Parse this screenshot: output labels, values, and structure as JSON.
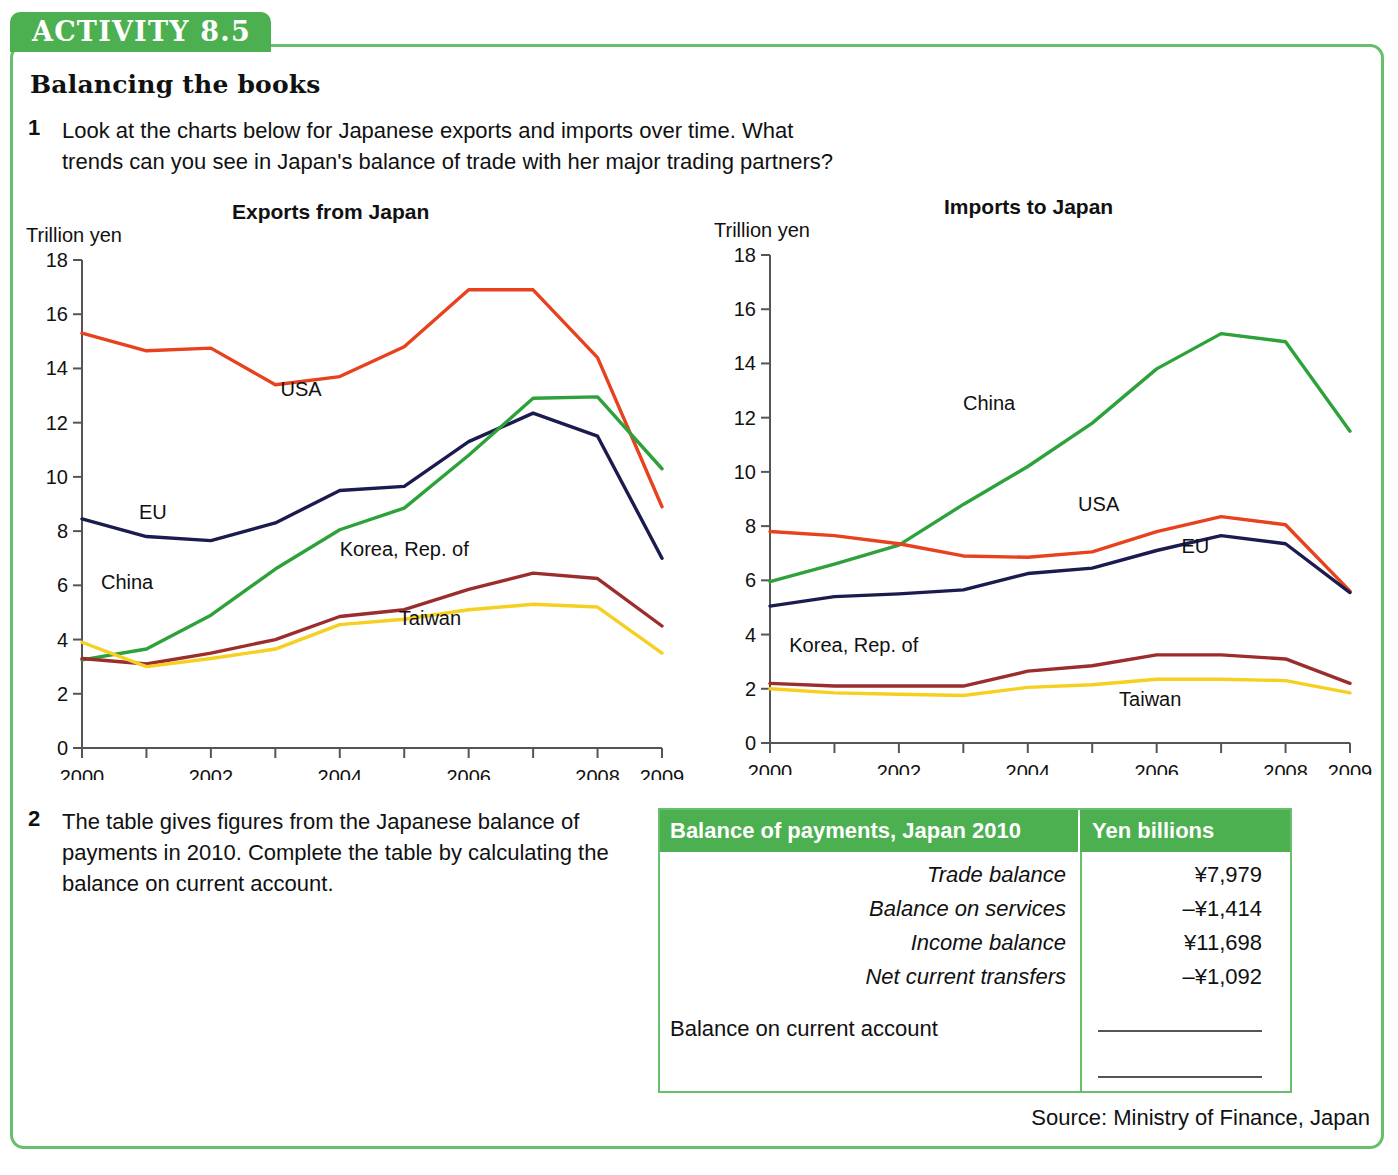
{
  "activity": {
    "tab_label": "ACTIVITY 8.5",
    "title": "Balancing the books"
  },
  "questions": [
    {
      "number": "1",
      "text": "Look at the charts below for Japanese exports and imports over time. What trends can you see in Japan's balance of trade with her major trading partners?"
    },
    {
      "number": "2",
      "text": "The table gives figures from the Japanese balance of payments in 2010. Complete the table by calculating the balance on current account."
    }
  ],
  "source_note": "Source: Ministry of Finance, Japan",
  "colors": {
    "brand_green": "#4CB050",
    "panel_border": "#67BE6B",
    "usa": "#E8411E",
    "eu": "#1B1B4F",
    "china": "#2DA13A",
    "korea": "#9B2D2D",
    "taiwan": "#F5D020"
  },
  "balance_table": {
    "header": {
      "label": "Balance of payments, Japan 2010",
      "units": "Yen billions"
    },
    "rows": [
      {
        "label": "Trade balance",
        "value": "¥7,979"
      },
      {
        "label": "Balance on services",
        "value": "–¥1,414"
      },
      {
        "label": "Income balance",
        "value": "¥11,698"
      },
      {
        "label": "Net current transfers",
        "value": "–¥1,092"
      }
    ],
    "total_row": {
      "label": "Balance on current account",
      "value": ""
    }
  },
  "chart_data": [
    {
      "type": "line",
      "title": "Exports from Japan",
      "ylabel": "Trillion yen",
      "xlabel": "",
      "ylim": [
        0,
        18
      ],
      "yticks": [
        0,
        2,
        4,
        6,
        8,
        10,
        12,
        14,
        16,
        18
      ],
      "xlim": [
        2000,
        2009
      ],
      "x": [
        2000,
        2001,
        2002,
        2003,
        2004,
        2005,
        2006,
        2007,
        2008,
        2009
      ],
      "xticks": [
        2000,
        2001,
        2002,
        2003,
        2004,
        2005,
        2006,
        2007,
        2008,
        2009
      ],
      "xticklabels": [
        "2000",
        "",
        "2002",
        "",
        "2004",
        "",
        "2006",
        "",
        "2008",
        "2009"
      ],
      "grid": false,
      "legend": "inline-labels",
      "series": [
        {
          "name": "USA",
          "color": "#E8411E",
          "label_pos": [
            2003.4,
            13.0
          ],
          "values": [
            15.3,
            14.65,
            14.75,
            13.4,
            13.7,
            14.8,
            16.9,
            16.9,
            14.4,
            8.9
          ]
        },
        {
          "name": "EU",
          "color": "#1B1B4F",
          "label_pos": [
            2001.1,
            8.45
          ],
          "values": [
            8.45,
            7.8,
            7.65,
            8.3,
            9.5,
            9.65,
            11.3,
            12.35,
            11.5,
            7.0
          ]
        },
        {
          "name": "China",
          "color": "#2DA13A",
          "label_pos": [
            2000.7,
            5.85
          ],
          "values": [
            3.25,
            3.65,
            4.9,
            6.6,
            8.05,
            8.85,
            10.8,
            12.9,
            12.95,
            10.3
          ]
        },
        {
          "name": "Korea, Rep. of",
          "color": "#9B2D2D",
          "label_pos": [
            2005.0,
            7.1
          ],
          "values": [
            3.3,
            3.1,
            3.5,
            4.0,
            4.85,
            5.1,
            5.85,
            6.45,
            6.25,
            4.5
          ]
        },
        {
          "name": "Taiwan",
          "color": "#F5D020",
          "label_pos": [
            2005.4,
            4.55
          ],
          "values": [
            3.9,
            3.0,
            3.3,
            3.65,
            4.55,
            4.75,
            5.1,
            5.3,
            5.2,
            3.5
          ]
        }
      ]
    },
    {
      "type": "line",
      "title": "Imports to Japan",
      "ylabel": "Trillion yen",
      "xlabel": "",
      "ylim": [
        0,
        18
      ],
      "yticks": [
        0,
        2,
        4,
        6,
        8,
        10,
        12,
        14,
        16,
        18
      ],
      "xlim": [
        2000,
        2009
      ],
      "x": [
        2000,
        2001,
        2002,
        2003,
        2004,
        2005,
        2006,
        2007,
        2008,
        2009
      ],
      "xticks": [
        2000,
        2001,
        2002,
        2003,
        2004,
        2005,
        2006,
        2007,
        2008,
        2009
      ],
      "xticklabels": [
        "2000",
        "",
        "2002",
        "",
        "2004",
        "",
        "2006",
        "",
        "2008",
        "2009"
      ],
      "grid": false,
      "legend": "inline-labels",
      "series": [
        {
          "name": "China",
          "color": "#2DA13A",
          "label_pos": [
            2003.4,
            12.3
          ],
          "values": [
            5.95,
            6.6,
            7.3,
            8.8,
            10.2,
            11.8,
            13.8,
            15.1,
            14.8,
            11.5
          ]
        },
        {
          "name": "USA",
          "color": "#E8411E",
          "label_pos": [
            2005.1,
            8.55
          ],
          "values": [
            7.8,
            7.65,
            7.35,
            6.9,
            6.85,
            7.05,
            7.8,
            8.35,
            8.05,
            5.6
          ]
        },
        {
          "name": "EU",
          "color": "#1B1B4F",
          "label_pos": [
            2006.6,
            7.0
          ],
          "values": [
            5.05,
            5.4,
            5.5,
            5.65,
            6.25,
            6.45,
            7.1,
            7.65,
            7.35,
            5.55
          ]
        },
        {
          "name": "Korea, Rep. of",
          "color": "#9B2D2D",
          "label_pos": [
            2001.3,
            3.35
          ],
          "values": [
            2.2,
            2.1,
            2.1,
            2.1,
            2.65,
            2.85,
            3.25,
            3.25,
            3.1,
            2.2
          ]
        },
        {
          "name": "Taiwan",
          "color": "#F5D020",
          "label_pos": [
            2005.9,
            1.35
          ],
          "values": [
            2.0,
            1.85,
            1.8,
            1.75,
            2.05,
            2.15,
            2.35,
            2.35,
            2.3,
            1.85
          ]
        }
      ]
    }
  ]
}
